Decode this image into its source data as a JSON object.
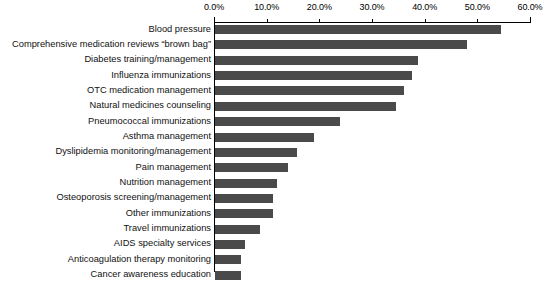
{
  "chart_data": {
    "type": "bar",
    "orientation": "horizontal",
    "title": "",
    "subtitle": "",
    "xlabel": "",
    "ylabel": "",
    "xlim": [
      0.0,
      60.0
    ],
    "xticks": [
      0.0,
      10.0,
      20.0,
      30.0,
      40.0,
      50.0,
      60.0
    ],
    "xtick_labels": [
      "0.0%",
      "10.0%",
      "20.0%",
      "30.0%",
      "40.0%",
      "50.0%",
      "60.0%"
    ],
    "grid": false,
    "legend": null,
    "bar_color": "#4a4a4a",
    "axis_color": "#000000",
    "value_suffix": "%",
    "categories": [
      "Blood pressure",
      "Comprehensive medication reviews “brown bag”",
      "Diabetes training/management",
      "Influenza immunizations",
      "OTC medication management",
      "Natural medicines counseling",
      "Pneumococcal immunizations",
      "Asthma management",
      "Dyslipidemia monitoring/management",
      "Pain management",
      "Nutrition management",
      "Osteoporosis screening/management",
      "Other immunizations",
      "Travel immunizations",
      "AIDS specialty services",
      "Anticoagulation therapy monitoring",
      "Cancer awareness education"
    ],
    "values": [
      54.5,
      48.0,
      38.8,
      37.6,
      36.0,
      34.5,
      24.0,
      19.0,
      15.8,
      14.0,
      12.0,
      11.2,
      11.2,
      8.7,
      5.9,
      5.2,
      5.2
    ]
  }
}
